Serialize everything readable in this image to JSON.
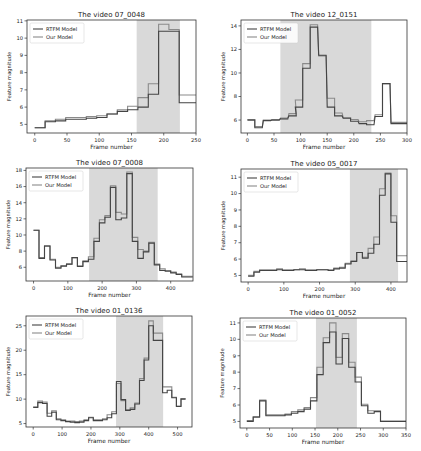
{
  "figure": {
    "background": "#ffffff",
    "shade_color": "#d9d9d9",
    "rtfm_color": "#444444",
    "ours_color": "#8a8a8a"
  },
  "legend": {
    "rtfm_label": "RTFM Model",
    "ours_label": "Our Model"
  },
  "chart_data": [
    {
      "type": "line",
      "title": "The video 07_0048",
      "xlabel": "Frame number",
      "ylabel": "Feature magnitude",
      "xlim": [
        -12,
        250
      ],
      "ylim": [
        4.5,
        11.05
      ],
      "xticks": [
        0,
        50,
        100,
        150,
        200,
        250
      ],
      "yticks": [
        5,
        6,
        7,
        8,
        9,
        10,
        11
      ],
      "shaded": [
        158,
        225
      ],
      "box": {
        "x": 27,
        "y": 20,
        "w": 169,
        "h": 113
      },
      "series": [
        {
          "name": "RTFM Model",
          "x": [
            0,
            16,
            32,
            48,
            64,
            80,
            96,
            112,
            128,
            144,
            160,
            176,
            192,
            208,
            224,
            240
          ],
          "values": [
            4.8,
            5.15,
            5.2,
            5.3,
            5.3,
            5.35,
            5.4,
            5.6,
            5.75,
            5.85,
            6.0,
            6.75,
            10.4,
            10.4,
            6.25,
            6.25
          ]
        },
        {
          "name": "Our Model",
          "x": [
            0,
            16,
            32,
            48,
            64,
            80,
            96,
            112,
            128,
            144,
            160,
            176,
            192,
            208,
            224,
            240
          ],
          "values": [
            4.8,
            5.2,
            5.3,
            5.4,
            5.4,
            5.45,
            5.5,
            5.6,
            5.85,
            6.05,
            6.55,
            7.35,
            10.8,
            10.5,
            6.7,
            6.7
          ]
        }
      ],
      "grid": false,
      "legend_position": "upper left"
    },
    {
      "type": "line",
      "title": "The video 12_0151",
      "xlabel": "Frame number",
      "ylabel": "Feature magnitude",
      "xlim": [
        -12,
        300
      ],
      "ylim": [
        4.9,
        14.5
      ],
      "xticks": [
        0,
        50,
        100,
        150,
        200,
        250,
        300
      ],
      "yticks": [
        6,
        8,
        10,
        12,
        14
      ],
      "shaded": [
        62,
        233
      ],
      "box": {
        "x": 241,
        "y": 20,
        "w": 166,
        "h": 113
      },
      "series": [
        {
          "name": "RTFM Model",
          "x": [
            0,
            14,
            30,
            46,
            62,
            78,
            90,
            104,
            118,
            134,
            150,
            164,
            180,
            194,
            210,
            224,
            240,
            254,
            270,
            286
          ],
          "values": [
            6.0,
            5.35,
            5.95,
            6.0,
            6.15,
            6.35,
            7.1,
            10.4,
            13.9,
            11.5,
            7.1,
            6.35,
            6.15,
            5.9,
            5.7,
            5.6,
            6.3,
            9.1,
            5.7,
            5.7
          ]
        },
        {
          "name": "Our Model",
          "x": [
            0,
            14,
            30,
            46,
            62,
            78,
            90,
            104,
            118,
            134,
            150,
            164,
            180,
            194,
            210,
            224,
            240,
            254,
            270,
            286
          ],
          "values": [
            6.05,
            5.45,
            6.0,
            6.05,
            6.05,
            6.55,
            7.7,
            10.8,
            14.1,
            11.45,
            7.85,
            6.6,
            6.2,
            6.05,
            5.85,
            5.95,
            6.45,
            9.1,
            5.8,
            5.8
          ]
        }
      ],
      "grid": false,
      "legend_position": "upper left"
    },
    {
      "type": "line",
      "title": "The video 07_0008",
      "xlabel": "Frame number",
      "ylabel": "Feature magnitude",
      "xlim": [
        -22,
        465
      ],
      "ylim": [
        4.3,
        18.3
      ],
      "xticks": [
        0,
        100,
        200,
        300,
        400
      ],
      "yticks": [
        6,
        8,
        10,
        12,
        14,
        16,
        18
      ],
      "shaded": [
        162,
        362
      ],
      "box": {
        "x": 26,
        "y": 168,
        "w": 167,
        "h": 113
      },
      "series": [
        {
          "name": "RTFM Model",
          "x": [
            0,
            16,
            32,
            48,
            64,
            80,
            96,
            112,
            128,
            144,
            160,
            176,
            192,
            208,
            224,
            240,
            256,
            272,
            288,
            304,
            320,
            336,
            352,
            368,
            384,
            400,
            416,
            432,
            448
          ],
          "values": [
            10.6,
            7.1,
            8.6,
            6.9,
            5.9,
            6.15,
            6.4,
            7.2,
            6.1,
            6.7,
            7.0,
            9.2,
            11.5,
            12.2,
            15.9,
            11.9,
            12.1,
            17.6,
            9.2,
            7.1,
            7.9,
            9.0,
            6.3,
            5.6,
            5.5,
            5.3,
            5.1,
            4.8,
            4.8
          ]
        },
        {
          "name": "Our Model",
          "x": [
            0,
            16,
            32,
            48,
            64,
            80,
            96,
            112,
            128,
            144,
            160,
            176,
            192,
            208,
            224,
            240,
            256,
            272,
            288,
            304,
            320,
            336,
            352,
            368,
            384,
            400,
            416,
            432,
            448
          ],
          "values": [
            10.6,
            7.2,
            8.7,
            7.0,
            6.0,
            6.2,
            6.4,
            7.2,
            6.2,
            6.8,
            7.3,
            9.6,
            11.9,
            12.4,
            16.1,
            12.8,
            12.6,
            17.8,
            9.7,
            8.2,
            8.0,
            9.1,
            6.4,
            5.8,
            5.6,
            5.4,
            5.2,
            4.9,
            4.9
          ]
        }
      ],
      "grid": false,
      "legend_position": "upper left"
    },
    {
      "type": "line",
      "title": "The video 05_0017",
      "xlabel": "Frame number",
      "ylabel": "Feature magnitude",
      "xlim": [
        -20,
        445
      ],
      "ylim": [
        4.6,
        11.5
      ],
      "xticks": [
        0,
        100,
        200,
        300,
        400
      ],
      "yticks": [
        5,
        6,
        7,
        8,
        9,
        10,
        11
      ],
      "shaded": [
        285,
        420
      ],
      "box": {
        "x": 241,
        "y": 169,
        "w": 166,
        "h": 113
      },
      "series": [
        {
          "name": "RTFM Model",
          "x": [
            0,
            16,
            32,
            48,
            64,
            80,
            96,
            112,
            128,
            144,
            160,
            176,
            192,
            208,
            224,
            240,
            256,
            272,
            288,
            304,
            320,
            336,
            352,
            368,
            384,
            400,
            416,
            432
          ],
          "values": [
            4.95,
            5.2,
            5.3,
            5.3,
            5.3,
            5.35,
            5.3,
            5.3,
            5.35,
            5.35,
            5.3,
            5.3,
            5.35,
            5.35,
            5.3,
            5.4,
            5.45,
            5.7,
            5.85,
            6.4,
            6.05,
            6.35,
            6.9,
            9.9,
            11.2,
            8.25,
            5.85,
            5.85
          ]
        },
        {
          "name": "Our Model",
          "x": [
            0,
            16,
            32,
            48,
            64,
            80,
            96,
            112,
            128,
            144,
            160,
            176,
            192,
            208,
            224,
            240,
            256,
            272,
            288,
            304,
            320,
            336,
            352,
            368,
            384,
            400,
            416,
            432
          ],
          "values": [
            5.0,
            5.25,
            5.35,
            5.35,
            5.35,
            5.4,
            5.35,
            5.35,
            5.35,
            5.4,
            5.35,
            5.35,
            5.35,
            5.35,
            5.35,
            5.45,
            5.5,
            5.75,
            5.9,
            6.4,
            6.1,
            6.65,
            7.35,
            10.3,
            11.25,
            8.65,
            6.2,
            6.2
          ]
        }
      ],
      "grid": false,
      "legend_position": "upper left"
    },
    {
      "type": "line",
      "title": "The video 01_0136",
      "xlabel": "Frame number",
      "ylabel": "Feature magnitude",
      "xlim": [
        -25,
        550
      ],
      "ylim": [
        4.3,
        27
      ],
      "xticks": [
        0,
        100,
        200,
        300,
        400,
        500
      ],
      "yticks": [
        5,
        10,
        15,
        20,
        25
      ],
      "shaded": [
        287,
        450
      ],
      "box": {
        "x": 26,
        "y": 316,
        "w": 166,
        "h": 111
      },
      "series": [
        {
          "name": "RTFM Model",
          "x": [
            0,
            16,
            32,
            48,
            64,
            80,
            96,
            112,
            128,
            144,
            160,
            176,
            192,
            208,
            224,
            240,
            256,
            272,
            288,
            304,
            320,
            336,
            352,
            368,
            384,
            400,
            416,
            432,
            448,
            464,
            480,
            496,
            512
          ],
          "values": [
            8.3,
            9.3,
            9.1,
            6.5,
            7.3,
            5.8,
            5.6,
            5.4,
            5.3,
            5.2,
            5.3,
            5.6,
            6.2,
            5.6,
            5.6,
            5.8,
            6.2,
            7.0,
            13.6,
            9.9,
            7.7,
            7.9,
            9.0,
            13.8,
            18.0,
            25.0,
            22.0,
            22.0,
            11.3,
            11.8,
            10.3,
            8.5,
            10.0
          ]
        },
        {
          "name": "Our Model",
          "x": [
            0,
            16,
            32,
            48,
            64,
            80,
            96,
            112,
            128,
            144,
            160,
            176,
            192,
            208,
            224,
            240,
            256,
            272,
            288,
            304,
            320,
            336,
            352,
            368,
            384,
            400,
            416,
            432,
            448,
            464,
            480,
            496,
            512
          ],
          "values": [
            8.4,
            9.6,
            9.4,
            7.1,
            7.6,
            6.0,
            5.8,
            5.5,
            5.5,
            5.4,
            5.5,
            5.8,
            6.3,
            5.8,
            5.8,
            6.0,
            6.8,
            7.4,
            13.2,
            9.7,
            7.8,
            8.2,
            9.2,
            14.2,
            18.4,
            26.0,
            23.5,
            23.5,
            12.5,
            12.5,
            10.4,
            8.6,
            10.1
          ]
        }
      ],
      "grid": false,
      "legend_position": "upper left"
    },
    {
      "type": "line",
      "title": "The video 01_0052",
      "xlabel": "Frame number",
      "ylabel": "Feature magnitude",
      "xlim": [
        -15,
        350
      ],
      "ylim": [
        4.6,
        11.3
      ],
      "xticks": [
        0,
        50,
        100,
        150,
        200,
        250,
        300,
        350
      ],
      "yticks": [
        5,
        6,
        7,
        8,
        9,
        10,
        11
      ],
      "shaded": [
        152,
        242
      ],
      "box": {
        "x": 240,
        "y": 318,
        "w": 166,
        "h": 110
      },
      "series": [
        {
          "name": "RTFM Model",
          "x": [
            0,
            14,
            28,
            42,
            56,
            70,
            84,
            98,
            112,
            126,
            140,
            154,
            168,
            182,
            196,
            210,
            224,
            238,
            252,
            266,
            280,
            294,
            308,
            322,
            336
          ],
          "values": [
            5.0,
            5.25,
            6.25,
            5.35,
            5.35,
            5.35,
            5.4,
            5.5,
            5.6,
            5.75,
            6.25,
            7.85,
            9.8,
            10.45,
            8.5,
            10.05,
            8.3,
            7.4,
            5.95,
            5.5,
            5.6,
            5.0,
            5.0,
            5.0,
            5.0
          ]
        },
        {
          "name": "Our Model",
          "x": [
            0,
            14,
            28,
            42,
            56,
            70,
            84,
            98,
            112,
            126,
            140,
            154,
            168,
            182,
            196,
            210,
            224,
            238,
            252,
            266,
            280,
            294,
            308,
            322,
            336
          ],
          "values": [
            5.05,
            5.3,
            6.3,
            5.4,
            5.4,
            5.4,
            5.45,
            5.6,
            5.7,
            5.85,
            6.45,
            8.3,
            10.1,
            11.0,
            8.9,
            10.35,
            8.6,
            7.7,
            6.05,
            5.65,
            5.65,
            5.0,
            5.0,
            5.0,
            5.0
          ]
        }
      ],
      "grid": false,
      "legend_position": "upper left"
    }
  ]
}
